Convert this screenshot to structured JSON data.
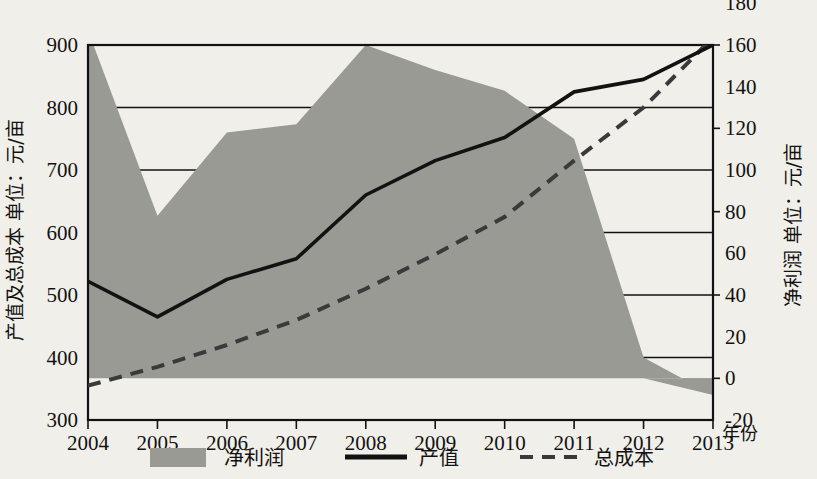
{
  "chart_data": {
    "type": "area",
    "title": "",
    "xlabel": "年份",
    "ylabel_left": "产值及总成本 单位：元/亩",
    "ylabel_right": "净利润 单位：元/亩",
    "categories": [
      "2004",
      "2005",
      "2006",
      "2007",
      "2008",
      "2009",
      "2010",
      "2011",
      "2012",
      "2013"
    ],
    "ylim_left": [
      300,
      900
    ],
    "yticks_left": [
      "300",
      "400",
      "500",
      "600",
      "700",
      "800",
      "900"
    ],
    "ylim_right": [
      -20,
      180
    ],
    "yticks_right": [
      "-20",
      "0",
      "20",
      "40",
      "60",
      "80",
      "100",
      "120",
      "140",
      "160",
      "180"
    ],
    "grid": true,
    "legend_position": "bottom",
    "series": [
      {
        "name": "净利润",
        "style": "area",
        "axis": "right",
        "color": "#9a9a95",
        "values": [
          167,
          78,
          118,
          122,
          160,
          148,
          138,
          115,
          10,
          -8
        ]
      },
      {
        "name": "产值",
        "style": "solid-line",
        "axis": "left",
        "color": "#121212",
        "values": [
          522,
          465,
          525,
          558,
          660,
          715,
          752,
          825,
          845,
          900
        ]
      },
      {
        "name": "总成本",
        "style": "dashed-line",
        "axis": "left",
        "color": "#3a3a3a",
        "values": [
          355,
          385,
          420,
          460,
          510,
          565,
          625,
          715,
          800,
          912
        ]
      }
    ]
  },
  "legend": {
    "items": [
      {
        "label": "净利润",
        "marker": "area-swatch"
      },
      {
        "label": "产值",
        "marker": "solid-line"
      },
      {
        "label": "总成本",
        "marker": "dashed-line"
      }
    ]
  },
  "colors": {
    "background": "#f1efe9",
    "area_fill": "#9a9a95",
    "axis": "#121212",
    "grid": "#121212"
  }
}
